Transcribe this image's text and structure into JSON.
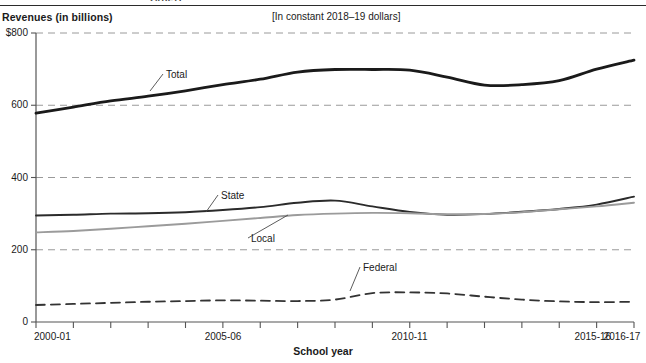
{
  "figure": {
    "clipped_header_text": "2016-17",
    "y_axis_title": "Revenues (in billions)",
    "subtitle": "[In constant 2018–19 dollars]",
    "x_axis_title": "School year"
  },
  "chart_data": {
    "type": "line",
    "title": "Revenues (in billions)",
    "subtitle": "[In constant 2018–19 dollars]",
    "xlabel": "School year",
    "ylabel": "Revenues (in billions)",
    "ylim": [
      0,
      800
    ],
    "ytick_labels": [
      "$800",
      "600",
      "400",
      "200",
      "0"
    ],
    "ytick_values": [
      800,
      600,
      400,
      200,
      0
    ],
    "grid": "horizontal-dashed",
    "legend": "inline-annotations",
    "x": [
      "2000-01",
      "2001-02",
      "2002-03",
      "2003-04",
      "2004-05",
      "2005-06",
      "2006-07",
      "2007-08",
      "2008-09",
      "2009-10",
      "2010-11",
      "2011-12",
      "2012-13",
      "2013-14",
      "2014-15",
      "2015-16",
      "2016-17"
    ],
    "xtick_labels": [
      "2000-01",
      "2005-06",
      "2010-11",
      "2015-16",
      "2016-17"
    ],
    "xtick_label_indices": [
      0,
      5,
      10,
      15,
      16
    ],
    "series": [
      {
        "name": "Total",
        "style": "solid-thick",
        "color": "#1a1a1a",
        "values": [
          578,
          595,
          612,
          625,
          640,
          657,
          672,
          692,
          699,
          699,
          697,
          678,
          656,
          657,
          668,
          700,
          725
        ]
      },
      {
        "name": "State",
        "style": "solid-medium",
        "color": "#2b2b2b",
        "values": [
          295,
          297,
          300,
          301,
          304,
          310,
          318,
          330,
          336,
          320,
          305,
          297,
          299,
          305,
          313,
          325,
          347
        ]
      },
      {
        "name": "Local",
        "style": "solid-light",
        "color": "#9b9b9b",
        "values": [
          248,
          252,
          258,
          265,
          272,
          280,
          288,
          296,
          300,
          302,
          301,
          298,
          299,
          304,
          312,
          320,
          330
        ]
      },
      {
        "name": "Federal",
        "style": "dashed",
        "color": "#333333",
        "values": [
          47,
          50,
          53,
          56,
          58,
          60,
          59,
          58,
          62,
          80,
          82,
          79,
          70,
          62,
          57,
          55,
          56
        ]
      }
    ],
    "annotations": [
      {
        "label": "Total",
        "label_x": 166,
        "label_y": 70,
        "leader_to_x": 150,
        "leader_to_y": 91
      },
      {
        "label": "State",
        "label_x": 221,
        "label_y": 191,
        "leader_to_x": 206,
        "leader_to_y": 212
      },
      {
        "label": "Local",
        "label_x": 251,
        "label_y": 234,
        "leader_to_x": 288,
        "leader_to_y": 215
      },
      {
        "label": "Federal",
        "label_x": 363,
        "label_y": 263,
        "leader_to_x": 350,
        "leader_to_y": 291
      }
    ]
  }
}
